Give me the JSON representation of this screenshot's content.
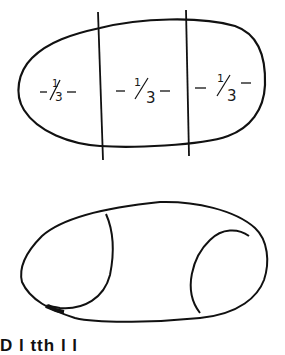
{
  "figure_top": {
    "shape": "ellipse divided into thirds",
    "sections": [
      {
        "label": "-1/3-",
        "num": "1",
        "den": "3"
      },
      {
        "label": "-1/3-",
        "num": "1",
        "den": "3"
      },
      {
        "label": "-1/3-",
        "num": "1",
        "den": "3"
      }
    ],
    "dividers": 2
  },
  "figure_bottom": {
    "shape": "irregular oval with two inner curved lines"
  },
  "caption": {
    "text": "D l   tth l l"
  },
  "colors": {
    "stroke": "#111111",
    "background": "#ffffff"
  }
}
